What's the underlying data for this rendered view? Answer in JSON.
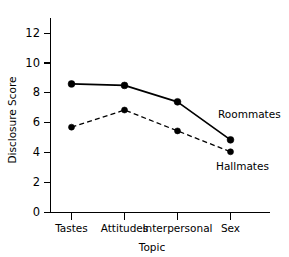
{
  "chart_data": {
    "type": "line",
    "title": "",
    "xlabel": "Topic",
    "ylabel": "Disclosure Score",
    "categories": [
      "Tastes",
      "Attitudes",
      "Interpersonal",
      "Sex"
    ],
    "series": [
      {
        "name": "Roommates",
        "values": [
          8.6,
          8.5,
          7.4,
          4.85
        ],
        "linestyle": "solid",
        "marker": "filled-circle",
        "color": "#000000"
      },
      {
        "name": "Hallmates",
        "values": [
          5.7,
          6.85,
          5.45,
          4.05
        ],
        "linestyle": "dashed",
        "marker": "filled-circle",
        "color": "#000000"
      }
    ],
    "ylim": [
      0,
      13
    ],
    "yticks": [
      0,
      2,
      4,
      6,
      8,
      10,
      12
    ],
    "ytick_labels": [
      "0",
      "2",
      "4",
      "6",
      "8",
      "10",
      "12"
    ],
    "grid": false,
    "legend_position": "inline-right-of-last-point"
  },
  "axes": {
    "y_title": "Disclosure Score",
    "x_title": "Topic",
    "y_tick_labels": [
      "12",
      "10",
      "8",
      "6",
      "4",
      "2",
      "0"
    ],
    "x_tick_labels": [
      "Tastes",
      "Attitudes",
      "Interpersonal",
      "Sex"
    ]
  },
  "annotations": {
    "roommates_label": "Roommates",
    "hallmates_label": "Hallmates"
  },
  "colors": {
    "background": "#ffffff",
    "ink": "#000000"
  }
}
